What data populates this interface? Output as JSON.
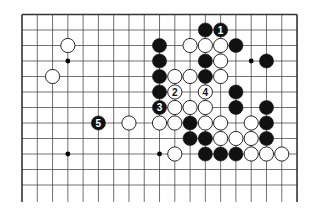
{
  "diagram": {
    "type": "go-board-partial",
    "background": "#ffffff",
    "line_color": "#333333",
    "grid": {
      "origin_x": 22,
      "origin_y": 14.5,
      "spacing_x": 15.28,
      "spacing_y": 15.5,
      "cols": 19,
      "rows_visible": 13,
      "bottom_y": 202,
      "edges": {
        "top": true,
        "left": true,
        "right": true,
        "bottom": false
      }
    },
    "hoshi": [
      {
        "col": 3,
        "row": 3
      },
      {
        "col": 15,
        "row": 3
      },
      {
        "col": 3,
        "row": 9
      },
      {
        "col": 9,
        "row": 9
      }
    ],
    "stones": [
      {
        "col": 12,
        "row": 1,
        "color": "black"
      },
      {
        "col": 13,
        "row": 1,
        "color": "black",
        "label": "1"
      },
      {
        "col": 3,
        "row": 2,
        "color": "white"
      },
      {
        "col": 9,
        "row": 2,
        "color": "black"
      },
      {
        "col": 11,
        "row": 2,
        "color": "white"
      },
      {
        "col": 12,
        "row": 2,
        "color": "white"
      },
      {
        "col": 13,
        "row": 2,
        "color": "white"
      },
      {
        "col": 14,
        "row": 2,
        "color": "black"
      },
      {
        "col": 9,
        "row": 3,
        "color": "black"
      },
      {
        "col": 12,
        "row": 3,
        "color": "black"
      },
      {
        "col": 13,
        "row": 3,
        "color": "white"
      },
      {
        "col": 16,
        "row": 3,
        "color": "black"
      },
      {
        "col": 2,
        "row": 4,
        "color": "white"
      },
      {
        "col": 9,
        "row": 4,
        "color": "black"
      },
      {
        "col": 10,
        "row": 4,
        "color": "white"
      },
      {
        "col": 11,
        "row": 4,
        "color": "white"
      },
      {
        "col": 12,
        "row": 4,
        "color": "black"
      },
      {
        "col": 13,
        "row": 4,
        "color": "white"
      },
      {
        "col": 9,
        "row": 5,
        "color": "black"
      },
      {
        "col": 10,
        "row": 5,
        "color": "white",
        "label": "2"
      },
      {
        "col": 12,
        "row": 5,
        "color": "white",
        "label": "4"
      },
      {
        "col": 14,
        "row": 5,
        "color": "black"
      },
      {
        "col": 9,
        "row": 6,
        "color": "black",
        "label": "3"
      },
      {
        "col": 10,
        "row": 6,
        "color": "white"
      },
      {
        "col": 11,
        "row": 6,
        "color": "white"
      },
      {
        "col": 12,
        "row": 6,
        "color": "white"
      },
      {
        "col": 14,
        "row": 6,
        "color": "black"
      },
      {
        "col": 16,
        "row": 6,
        "color": "black"
      },
      {
        "col": 5,
        "row": 7,
        "color": "black",
        "label": "5"
      },
      {
        "col": 7,
        "row": 7,
        "color": "white"
      },
      {
        "col": 9,
        "row": 7,
        "color": "white"
      },
      {
        "col": 10,
        "row": 7,
        "color": "white"
      },
      {
        "col": 11,
        "row": 7,
        "color": "black"
      },
      {
        "col": 12,
        "row": 7,
        "color": "white"
      },
      {
        "col": 13,
        "row": 7,
        "color": "white"
      },
      {
        "col": 15,
        "row": 7,
        "color": "white"
      },
      {
        "col": 16,
        "row": 7,
        "color": "black"
      },
      {
        "col": 11,
        "row": 8,
        "color": "black"
      },
      {
        "col": 12,
        "row": 8,
        "color": "black"
      },
      {
        "col": 13,
        "row": 8,
        "color": "white"
      },
      {
        "col": 14,
        "row": 8,
        "color": "white"
      },
      {
        "col": 15,
        "row": 8,
        "color": "white"
      },
      {
        "col": 16,
        "row": 8,
        "color": "black"
      },
      {
        "col": 10,
        "row": 9,
        "color": "white"
      },
      {
        "col": 12,
        "row": 9,
        "color": "black"
      },
      {
        "col": 13,
        "row": 9,
        "color": "black"
      },
      {
        "col": 14,
        "row": 9,
        "color": "black"
      },
      {
        "col": 15,
        "row": 9,
        "color": "white"
      },
      {
        "col": 16,
        "row": 9,
        "color": "white"
      },
      {
        "col": 17,
        "row": 9,
        "color": "white"
      }
    ],
    "move_labels": [
      "1",
      "2",
      "3",
      "4",
      "5"
    ]
  }
}
